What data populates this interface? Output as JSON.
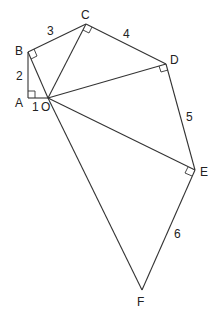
{
  "diagram": {
    "points": {
      "O": {
        "label": "O",
        "x": 48,
        "y": 98
      },
      "A": {
        "label": "A",
        "x": 28,
        "y": 98
      },
      "B": {
        "label": "B",
        "x": 28,
        "y": 52
      },
      "C": {
        "label": "C",
        "x": 86,
        "y": 24
      },
      "D": {
        "label": "D",
        "x": 166,
        "y": 64
      },
      "E": {
        "label": "E",
        "x": 195,
        "y": 170
      },
      "F": {
        "label": "F",
        "x": 142,
        "y": 290
      }
    },
    "segment_labels": {
      "OA": "1",
      "AB": "2",
      "BC": "3",
      "CD": "4",
      "DE": "5",
      "EF": "6"
    },
    "right_angles": [
      "A",
      "B",
      "C",
      "D",
      "E"
    ]
  }
}
